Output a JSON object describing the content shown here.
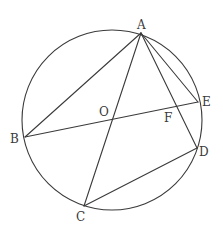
{
  "diagram": {
    "type": "geometry",
    "colors": {
      "stroke": "#3a3a3a",
      "background": "#ffffff"
    },
    "circle": {
      "center": "O",
      "cx": 112,
      "cy": 120,
      "r": 90
    },
    "points": {
      "A": {
        "label": "A",
        "x": 141,
        "y": 33
      },
      "B": {
        "label": "B",
        "x": 25,
        "y": 137
      },
      "C": {
        "label": "C",
        "x": 84,
        "y": 206
      },
      "D": {
        "label": "D",
        "x": 197,
        "y": 148
      },
      "E": {
        "label": "E",
        "x": 198,
        "y": 102
      },
      "O": {
        "label": "O",
        "x": 112,
        "y": 119
      },
      "F": {
        "label": "F",
        "x": 176,
        "y": 106
      }
    },
    "segments": [
      "AB",
      "AC",
      "AD",
      "AE",
      "BE",
      "CD"
    ],
    "labels": {
      "A": "A",
      "B": "B",
      "C": "C",
      "D": "D",
      "E": "E",
      "O": "O",
      "F": "F"
    }
  }
}
